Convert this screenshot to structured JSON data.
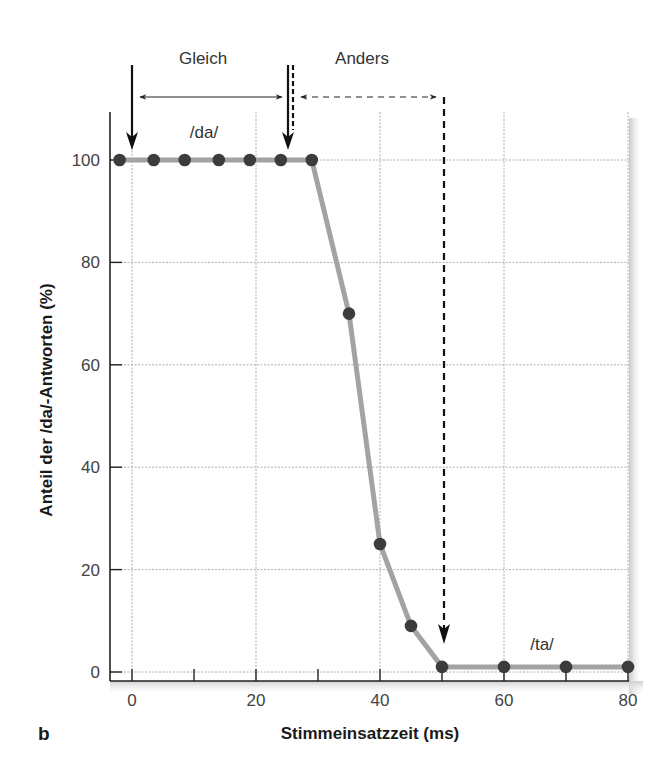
{
  "panel_label": "b",
  "chart_data": {
    "type": "line",
    "title": "",
    "xlabel": "Stimmeinsatzzeit (ms)",
    "ylabel": "Anteil der /da/-Antworten (%)",
    "xlim": [
      -3.5,
      80
    ],
    "ylim": [
      0,
      100
    ],
    "x_ticks": [
      0,
      20,
      40,
      60,
      80
    ],
    "x_minor_ticks": [
      10,
      30,
      50,
      70
    ],
    "y_ticks": [
      0,
      20,
      40,
      60,
      80,
      100
    ],
    "grid": true,
    "series": [
      {
        "name": "/da/-Antworten",
        "line_color": "#a3a3a3",
        "marker_color": "#3c3c3c",
        "x": [
          -2,
          3.5,
          8.5,
          14,
          19,
          24,
          29,
          35,
          40,
          45,
          50,
          60,
          70,
          80
        ],
        "y": [
          100,
          100,
          100,
          100,
          100,
          100,
          100,
          70,
          25,
          9,
          1,
          1,
          1,
          1
        ]
      }
    ],
    "annotations": {
      "phoneme_da": {
        "text": "/da/",
        "x": 11.5,
        "y": 105
      },
      "phoneme_ta": {
        "text": "/ta/",
        "x": 66,
        "y": 5.5
      },
      "same_range": {
        "label": "Gleich",
        "from": 0,
        "to": 25,
        "style": "solid"
      },
      "different_range": {
        "label": "Anders",
        "from": 25.5,
        "to": 50,
        "style": "dashed"
      }
    }
  }
}
